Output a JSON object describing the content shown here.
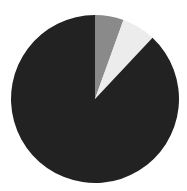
{
  "chart_data": {
    "type": "pie",
    "title": "",
    "labels": [
      "Slice A",
      "Slice B",
      "Slice C"
    ],
    "values": [
      5.5,
      6.5,
      88.0
    ],
    "colors": [
      "#8a8a8a",
      "#ececec",
      "#222222"
    ],
    "start_angle_deg": 0,
    "direction": "clockwise",
    "legend": "none",
    "center": [
      95,
      99
    ],
    "radius": 84
  }
}
